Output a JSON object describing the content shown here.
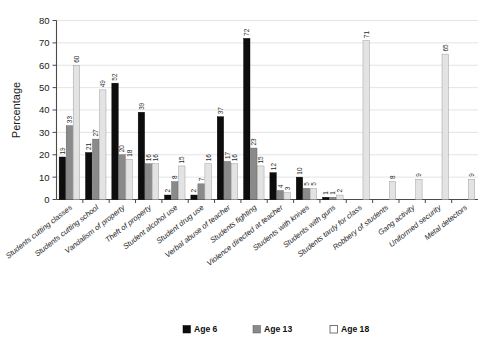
{
  "chart_data": {
    "type": "bar",
    "title": "",
    "subtitle": "",
    "xlabel": "",
    "ylabel": "Percentage",
    "ylim": [
      0,
      80
    ],
    "ytick_step": 10,
    "yticks": [
      0,
      10,
      20,
      30,
      40,
      50,
      60,
      70,
      80
    ],
    "grid": true,
    "legend_position": "bottom",
    "orientation": "vertical",
    "group_mode": "grouped",
    "categories": [
      "Students cutting classes",
      "Students cutting school",
      "Vandalism of property",
      "Theft of property",
      "Student alcohol use",
      "Student drug use",
      "Verbal abuse of teacher",
      "Students fighting",
      "Violence directed at teacher",
      "Students with knives",
      "Students with guns",
      "Students tardy for class",
      "Robbery of students",
      "Gang activity",
      "Uniformed security",
      "Metal detectors"
    ],
    "series": [
      {
        "name": "Age 6",
        "color": "#0d0d0d",
        "values": [
          19,
          21,
          52,
          39,
          2,
          2,
          37,
          72,
          12,
          10,
          1,
          null,
          null,
          null,
          null,
          null
        ]
      },
      {
        "name": "Age 13",
        "color": "#8a8a8a",
        "values": [
          33,
          27,
          20,
          16,
          8,
          7,
          17,
          23,
          4,
          5,
          1,
          null,
          null,
          null,
          null,
          null
        ]
      },
      {
        "name": "Age 18",
        "color": "#e3e3e3",
        "values": [
          60,
          49,
          18,
          16,
          15,
          16,
          16,
          15,
          3,
          5,
          2,
          71,
          8,
          9,
          65,
          9
        ]
      }
    ]
  },
  "legend": {
    "items": [
      {
        "label": "Age 6"
      },
      {
        "label": "Age 13"
      },
      {
        "label": "Age 18"
      }
    ]
  }
}
